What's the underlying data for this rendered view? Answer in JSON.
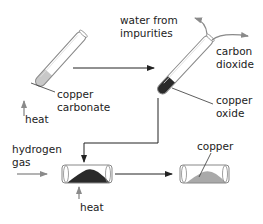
{
  "diagram": {
    "type": "process-flow",
    "labels": {
      "copper_carbonate": "copper\ncarbonate",
      "heat_1": "heat",
      "water_from_impurities": "water from\nimpurities",
      "carbon_dioxide": "carbon\ndioxide",
      "copper_oxide": "copper\noxide",
      "hydrogen_gas": "hydrogen\ngas",
      "heat_2": "heat",
      "copper": "copper"
    },
    "colors": {
      "line": "#333333",
      "gray_arrow": "#8a8a8a",
      "glass": "#888888",
      "copper_carbonate_fill": "#c8c8c8",
      "copper_oxide_fill": "#2a2a2a",
      "copper_fill": "#a9a9a9"
    }
  }
}
